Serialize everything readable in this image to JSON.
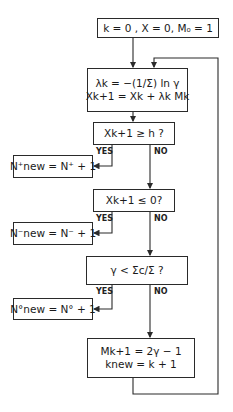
{
  "diagram": {
    "type": "flowchart",
    "nodes": {
      "init": {
        "text": "k = 0 , X = 0, M₀ = 1"
      },
      "update": {
        "line1": "λk = −(1/Σ) ln γ",
        "line2": "Xk+1 = Xk + λk Mk"
      },
      "test_h": {
        "text": "Xk+1 ≥ h ?"
      },
      "n_plus": {
        "text": "N⁺new = N⁺ + 1"
      },
      "test_zero": {
        "text": "Xk+1 ≤ 0?"
      },
      "n_minus": {
        "text": "N⁻new = N⁻ + 1"
      },
      "test_sigma": {
        "text": "γ < Σc/Σ ?"
      },
      "n_zero": {
        "text": "N°new = N° + 1"
      },
      "scatter": {
        "line1": "Mk+1 = 2γ − 1",
        "line2": "knew = k + 1"
      }
    },
    "labels": {
      "yes": "YES",
      "no": "NO"
    },
    "edges": [
      [
        "init",
        "update"
      ],
      [
        "update",
        "test_h"
      ],
      [
        "test_h",
        "n_plus",
        "YES"
      ],
      [
        "test_h",
        "test_zero",
        "NO"
      ],
      [
        "test_zero",
        "n_minus",
        "YES"
      ],
      [
        "test_zero",
        "test_sigma",
        "NO"
      ],
      [
        "test_sigma",
        "n_zero",
        "YES"
      ],
      [
        "test_sigma",
        "scatter",
        "NO"
      ],
      [
        "scatter",
        "update",
        "loop"
      ]
    ],
    "line_color": "#2a2a2a"
  }
}
